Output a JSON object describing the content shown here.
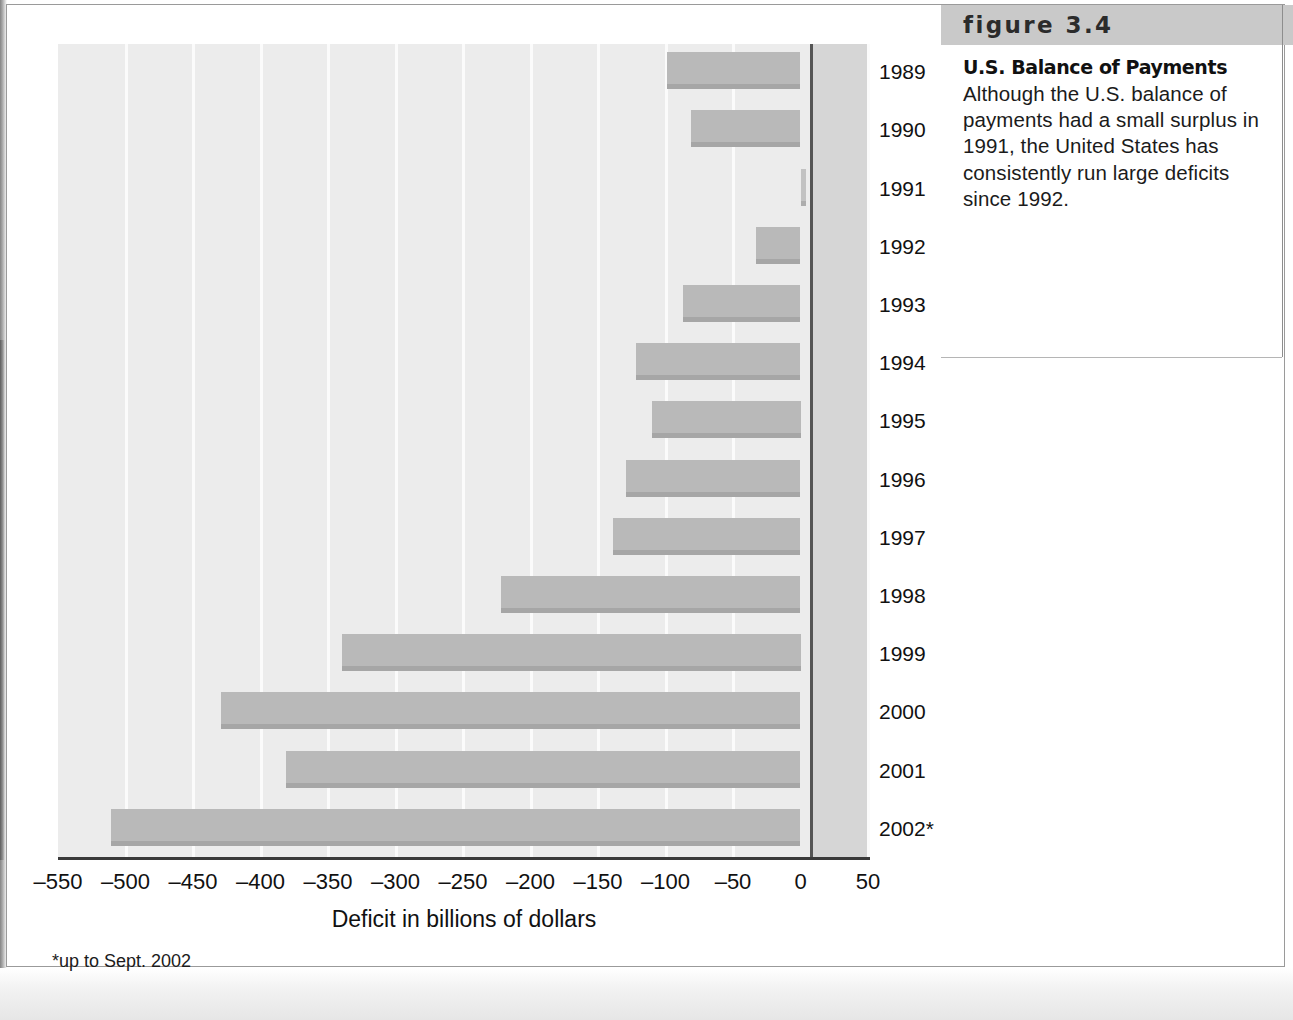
{
  "figure": {
    "banner_label": "figure 3.4",
    "title": "U.S. Balance of Payments",
    "caption": "Although the U.S. balance of payments had a small surplus in 1991, the United States has consistently run large deficits since 1992."
  },
  "chart_data": {
    "type": "bar",
    "orientation": "horizontal",
    "title": "U.S. Balance of Payments",
    "xlabel": "Deficit in billions of dollars",
    "ylabel": "",
    "xlim": [
      -550,
      50
    ],
    "xticks": [
      -550,
      -500,
      -450,
      -400,
      -350,
      -300,
      -250,
      -200,
      -150,
      -100,
      -50,
      0,
      50
    ],
    "xtick_labels": [
      "–550",
      "–500",
      "–450",
      "–400",
      "–350",
      "–300",
      "–250",
      "–200",
      "–150",
      "–100",
      "–50",
      "0",
      "50"
    ],
    "grid": true,
    "legend": false,
    "footnote": "*up to Sept. 2002",
    "categories": [
      "1989",
      "1990",
      "1991",
      "1992",
      "1993",
      "1994",
      "1995",
      "1996",
      "1997",
      "1998",
      "1999",
      "2000",
      "2001",
      "2002*"
    ],
    "values": [
      -99,
      -81,
      4,
      -33,
      -87,
      -122,
      -110,
      -129,
      -139,
      -222,
      -340,
      -429,
      -381,
      -511
    ],
    "bar_color": "#b9b9b9",
    "plot_background": "#ececec",
    "zero_line_color": "#555555"
  }
}
